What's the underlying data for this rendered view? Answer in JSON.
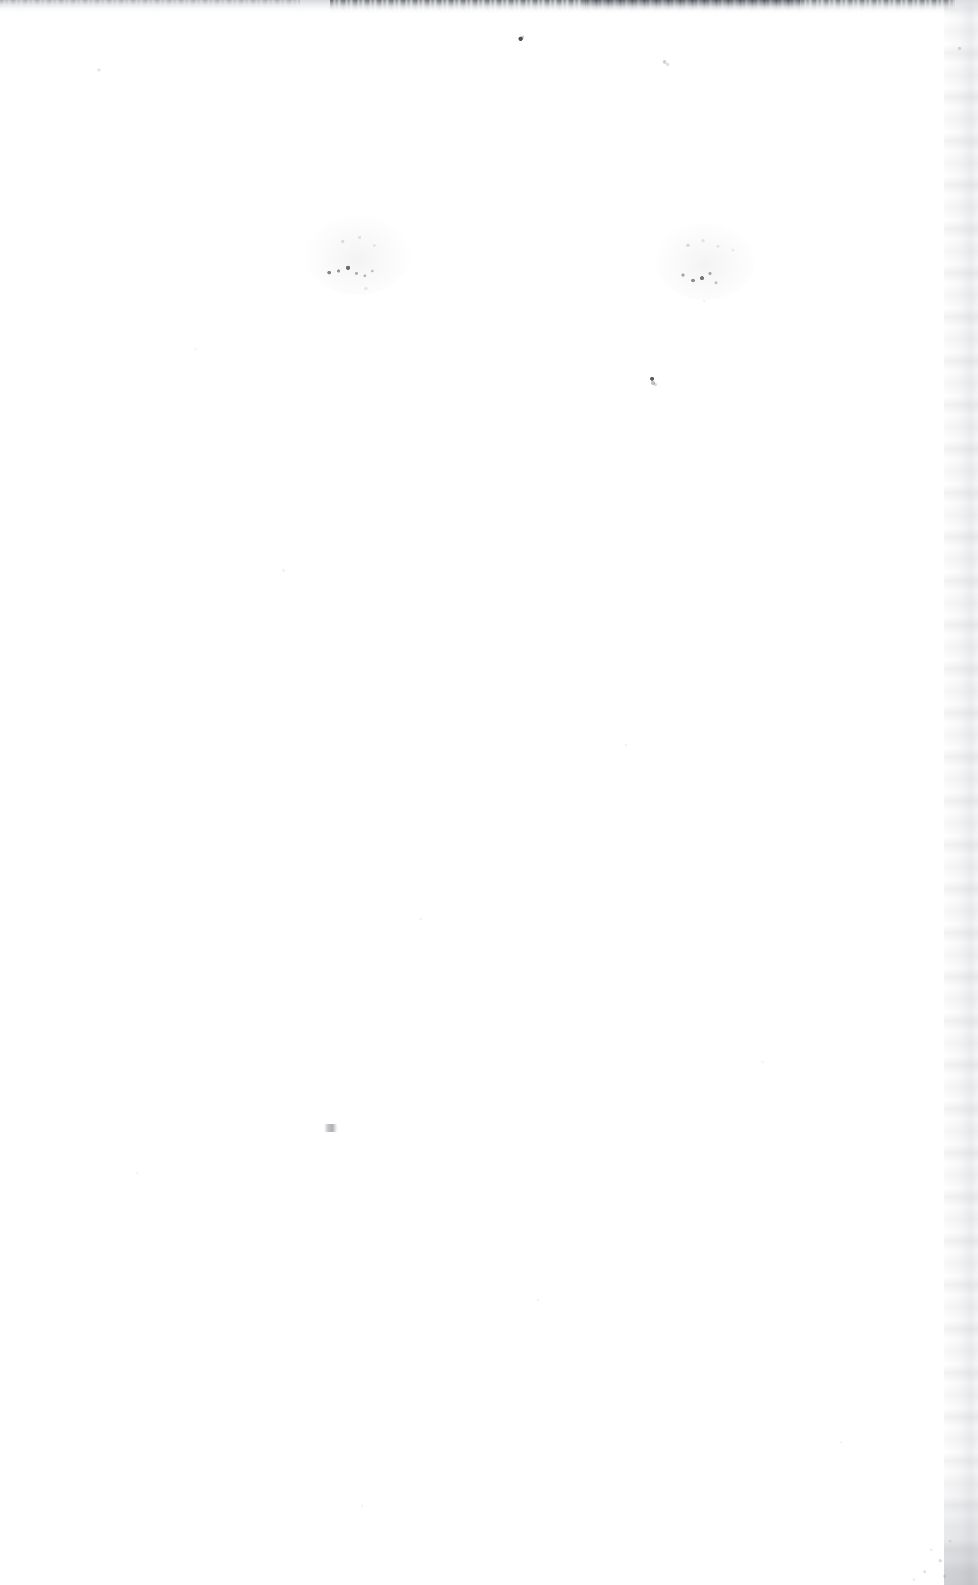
{
  "document": {
    "kind": "scanned-page",
    "content_state": "blank",
    "visible_text": "",
    "page_width": 978,
    "page_height": 1585,
    "paper_color": "#ffffff"
  },
  "artifacts": {
    "scan_edge_top": {
      "name": "top-scan-edge-artifact",
      "description": "ragged dark band along the top trimmed edge",
      "color": "#2d3038",
      "span_x": [
        330,
        955
      ],
      "height_px": 11
    },
    "scan_edge_right": {
      "name": "right-margin-band",
      "description": "faint vertical gray gutter band along the right edge",
      "color": "#dee0e4",
      "span_x": [
        944,
        978
      ]
    },
    "corner_noise": {
      "name": "bottom-right-dust-cloud",
      "description": "gray speckle concentration in the lower right corner",
      "color": "#787b82"
    },
    "smudges": [
      {
        "name": "ink-smudge-left",
        "description": "faint ink residue / show-through smudge",
        "x": 305,
        "y": 215,
        "width": 105,
        "height": 80,
        "color": "#3a3c44"
      },
      {
        "name": "ink-smudge-right",
        "description": "faint ink residue / show-through smudge",
        "x": 655,
        "y": 222,
        "width": 100,
        "height": 78,
        "color": "#3a3c44"
      }
    ],
    "specks": [
      {
        "name": "speck-top-center",
        "x": 516,
        "y": 34,
        "color": "#282a32"
      },
      {
        "name": "speck-upper-right",
        "x": 659,
        "y": 56,
        "color": "#969aa0"
      },
      {
        "name": "speck-mid",
        "x": 646,
        "y": 374,
        "color": "#2d2f37"
      },
      {
        "name": "speck-lower-left",
        "x": 324,
        "y": 1124,
        "color": "#696c74"
      },
      {
        "name": "speck-left-edge",
        "x": 95,
        "y": 66,
        "color": "#b9bcc3"
      },
      {
        "name": "speck-right-upper",
        "x": 955,
        "y": 44,
        "color": "#a5a8af"
      }
    ]
  },
  "accessibility": {
    "page_summary": "Blank scanned page, no printed text or figures."
  }
}
